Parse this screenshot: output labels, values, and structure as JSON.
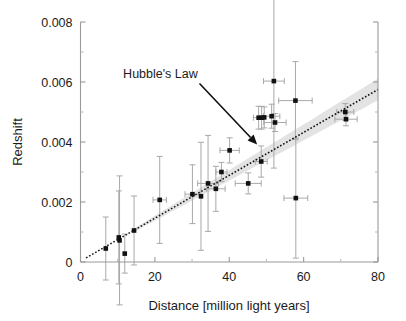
{
  "chart_data": {
    "type": "scatter",
    "title": "",
    "xlabel": "Distance [million light years]",
    "ylabel": "Redshift",
    "xlim": [
      0,
      80
    ],
    "ylim": [
      0,
      0.008
    ],
    "xticks": [
      0,
      20,
      40,
      60,
      80
    ],
    "xtick_labels": [
      "0",
      "20",
      "40",
      "60",
      "80"
    ],
    "yticks": [
      0,
      0.002,
      0.004,
      0.006,
      0.008
    ],
    "ytick_labels": [
      "0",
      "0.002",
      "0.004",
      "0.006",
      "0.008"
    ],
    "x_minor_ticks": [
      10,
      30,
      50,
      70
    ],
    "y_minor_ticks": [
      0.001,
      0.003,
      0.005,
      0.007
    ],
    "grid": false,
    "legend": null,
    "annotations": [
      {
        "text": "Hubble's Law",
        "text_x": 21.5,
        "text_y": 0.00615,
        "arrow_from_x": 32.0,
        "arrow_from_y": 0.00595,
        "arrow_to_x": 47.5,
        "arrow_to_y": 0.00392
      }
    ],
    "fit": {
      "name": "Hubble's Law",
      "style": "dotted",
      "slope": 7.15e-05,
      "intercept": 3e-05,
      "x_start": 1.5,
      "x_end": 80.0,
      "confidence_band": {
        "x_start": 14.0,
        "x_end": 80.0,
        "half_width_start": 5.5e-05,
        "half_width_end": 0.00036
      }
    },
    "series": [
      {
        "name": "Galaxies",
        "marker": "square",
        "color": "#111111",
        "points": [
          {
            "x": 6.8,
            "y": 0.00045,
            "xerr": 0.0,
            "yerr": 0.00105
          },
          {
            "x": 10.3,
            "y": 0.00082,
            "xerr": 0.0,
            "yerr": 0.00155
          },
          {
            "x": 10.5,
            "y": 0.00072,
            "xerr": 0.0,
            "yerr": 0.00215
          },
          {
            "x": 11.9,
            "y": 0.00028,
            "xerr": 0.0,
            "yerr": 0.00065
          },
          {
            "x": 14.4,
            "y": 0.00105,
            "xerr": 0.0,
            "yerr": 0.00115
          },
          {
            "x": 21.3,
            "y": 0.00207,
            "xerr": 1.8,
            "yerr": 0.00145
          },
          {
            "x": 30.1,
            "y": 0.00226,
            "xerr": 2.0,
            "yerr": 0.00098
          },
          {
            "x": 32.4,
            "y": 0.00219,
            "xerr": 0.0,
            "yerr": 0.0018
          },
          {
            "x": 34.3,
            "y": 0.00262,
            "xerr": 2.8,
            "yerr": 0.0016
          },
          {
            "x": 36.4,
            "y": 0.00244,
            "xerr": 2.5,
            "yerr": 0.00075
          },
          {
            "x": 37.9,
            "y": 0.003,
            "xerr": 1.5,
            "yerr": 0.00032
          },
          {
            "x": 40.1,
            "y": 0.00372,
            "xerr": 2.6,
            "yerr": 0.00042
          },
          {
            "x": 45.1,
            "y": 0.00262,
            "xerr": 3.5,
            "yerr": 0.00035
          },
          {
            "x": 47.9,
            "y": 0.00481,
            "xerr": 1.4,
            "yerr": 0.00038
          },
          {
            "x": 48.7,
            "y": 0.00481,
            "xerr": 0.0,
            "yerr": 0.00038
          },
          {
            "x": 49.4,
            "y": 0.00482,
            "xerr": 0.0,
            "yerr": 0.00035
          },
          {
            "x": 48.6,
            "y": 0.00335,
            "xerr": 1.6,
            "yerr": 0.00052
          },
          {
            "x": 51.4,
            "y": 0.00486,
            "xerr": 2.2,
            "yerr": 0.0004
          },
          {
            "x": 52.3,
            "y": 0.00465,
            "xerr": 3.0,
            "yerr": 0.0003
          },
          {
            "x": 52.0,
            "y": 0.00603,
            "xerr": 2.8,
            "yerr": 0.0029
          },
          {
            "x": 57.8,
            "y": 0.00538,
            "xerr": 4.5,
            "yerr": 0.0013
          },
          {
            "x": 57.9,
            "y": 0.00213,
            "xerr": 3.2,
            "yerr": 0.002
          },
          {
            "x": 71.2,
            "y": 0.005,
            "xerr": 2.3,
            "yerr": 0.00028
          },
          {
            "x": 71.4,
            "y": 0.00476,
            "xerr": 3.0,
            "yerr": 0.00022
          }
        ]
      }
    ],
    "colors": {
      "marker": "#111111",
      "errorbar": "#a8a8a8",
      "axis": "#9a9a9a",
      "fit_line": "#111111",
      "fit_band": "#cccccc",
      "text": "#1a1a1a",
      "background": "#ffffff"
    }
  }
}
